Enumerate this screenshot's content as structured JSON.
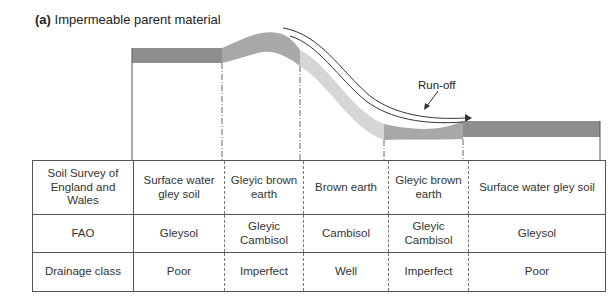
{
  "figure": {
    "label": "(a)",
    "title": "Impermeable parent material",
    "runoff_label": "Run-off"
  },
  "colors": {
    "dark_band": "#8c8c8c",
    "mid_band": "#a6a6a6",
    "light_band": "#d9d9d9",
    "line": "#555555"
  },
  "table": {
    "rows": [
      {
        "header": "Soil Survey of England and Wales",
        "cells": [
          "Surface water gley soil",
          "Gleyic brown earth",
          "Brown earth",
          "Gleyic brown earth",
          "Surface water gley soil"
        ]
      },
      {
        "header": "FAO",
        "cells": [
          "Gleysol",
          "Gleyic Cambisol",
          "Cambisol",
          "Gleyic Cambisol",
          "Gleysol"
        ]
      },
      {
        "header": "Drainage class",
        "cells": [
          "Poor",
          "Imperfect",
          "Well",
          "Imperfect",
          "Poor"
        ]
      }
    ]
  }
}
